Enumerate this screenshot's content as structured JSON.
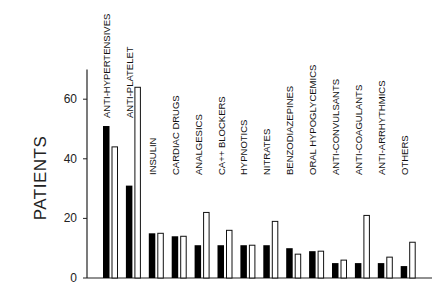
{
  "chart_data": {
    "type": "bar",
    "title": "",
    "xlabel": "",
    "ylabel": "PATIENTS",
    "ylim": [
      0,
      70
    ],
    "yticks": [
      0,
      20,
      40,
      60
    ],
    "grid": false,
    "legend": null,
    "categories": [
      "ANTI-HYPERTENSIVES",
      "ANTI-PLATELET",
      "INSULIN",
      "CARDIAC DRUGS",
      "ANALGESICS",
      "CA++ BLOCKERS",
      "HYPNOTICS",
      "NITRATES",
      "BENZODIAZEPINES",
      "ORAL HYPOGLYCEMICS",
      "ANTI-CONVULSANTS",
      "ANTI-COAGULANTS",
      "ANTI-ARRHYTHMICS",
      "OTHERS"
    ],
    "series": [
      {
        "name": "filled (black)",
        "color": "#000000",
        "values": [
          51,
          31,
          15,
          14,
          11,
          11,
          11,
          11,
          10,
          9,
          5,
          5,
          5,
          4
        ]
      },
      {
        "name": "open (white)",
        "color": "#ffffff",
        "values": [
          44,
          64,
          15,
          14,
          22,
          16,
          11,
          19,
          8,
          9,
          6,
          21,
          7,
          12
        ]
      }
    ]
  }
}
